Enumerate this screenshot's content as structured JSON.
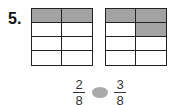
{
  "problem": {
    "number_label": "5.",
    "grids": [
      {
        "name": "left",
        "rows": 4,
        "cols": 2,
        "shaded_cells": [
          [
            0,
            0
          ],
          [
            0,
            1
          ]
        ]
      },
      {
        "name": "right",
        "rows": 4,
        "cols": 2,
        "shaded_cells": [
          [
            0,
            0
          ],
          [
            0,
            1
          ],
          [
            1,
            1
          ]
        ]
      }
    ],
    "comparison": {
      "left_fraction": {
        "numerator": "2",
        "denominator": "8"
      },
      "comparison_symbol_blank": "",
      "right_fraction": {
        "numerator": "3",
        "denominator": "8"
      }
    }
  },
  "colors": {
    "shade": "#a3a3a3",
    "grid_line": "#222222",
    "blank_oval": "#aaaaaa"
  }
}
